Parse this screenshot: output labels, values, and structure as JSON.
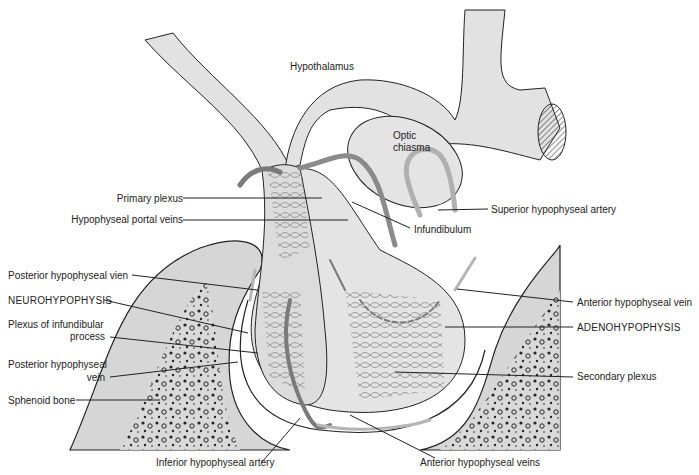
{
  "figure": {
    "colors": {
      "tissue": "#e2e2e2",
      "bone_fill": "#d6d6d6",
      "vessel": "#8a8a8a",
      "vessel_light": "#b5b5b5",
      "outline": "#222222",
      "background": "#ffffff"
    }
  },
  "labels": {
    "hypothalamus": "Hypothalamus",
    "optic_chiasma_1": "Optic",
    "optic_chiasma_2": "chiasma",
    "primary_plexus": "Primary plexus",
    "hypophyseal_portal_veins": "Hypophyseal portal veins",
    "infundibulum": "Infundibulum",
    "superior_hypophyseal_artery": "Superior hypophyseal artery",
    "posterior_hypophyseal_vien": "Posterior hypophyseal vien",
    "neurohypophysis": "NEUROHYPOPHYSIS",
    "plexus_infundibular_1": "Plexus of infundibular",
    "plexus_infundibular_2": "process",
    "posterior_hypophyseal_vein_1": "Posterior hypophyseal",
    "posterior_hypophyseal_vein_2": "vein",
    "sphenoid_bone": "Sphenoid bone",
    "inferior_hypophyseal_artery": "Inferior hypophyseal artery",
    "anterior_hypophyseal_veins": "Anterior hypophyseal veins",
    "anterior_hypophyseal_vein": "Anterior hypophyseal vein",
    "adenohypophysis": "ADENOHYPOPHYSIS",
    "secondary_plexus": "Secondary plexus"
  }
}
